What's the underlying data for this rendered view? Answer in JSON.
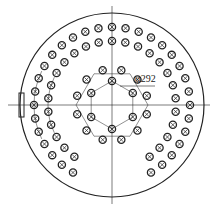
{
  "drawing": {
    "title": "Tube sheet hole layout",
    "dimension_label": "φ292",
    "colors": {
      "line": "#222222",
      "background": "#ffffff"
    },
    "center": [
      112,
      105
    ],
    "shell_radius": 92,
    "hole_radius": 3.6,
    "rings": [
      {
        "radius": 78,
        "count": 36,
        "gap_deg": 24
      },
      {
        "radius": 64,
        "count": 30,
        "gap_deg": 30
      },
      {
        "radius": 36,
        "count": 12,
        "offset_deg": 15
      },
      {
        "radius": 24,
        "count": 6,
        "offset_deg": 0
      }
    ]
  }
}
